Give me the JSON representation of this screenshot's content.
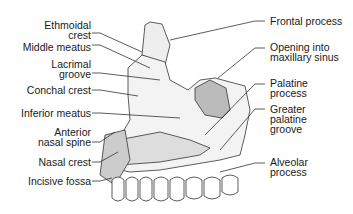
{
  "diagram": {
    "labels_left": [
      {
        "id": "ethmoidal-crest",
        "line1": "Ethmoidal",
        "line2": "crest"
      },
      {
        "id": "middle-meatus",
        "line1": "Middle meatus",
        "line2": ""
      },
      {
        "id": "lacrimal-groove",
        "line1": "Lacrimal",
        "line2": "groove"
      },
      {
        "id": "conchal-crest",
        "line1": "Conchal crest",
        "line2": ""
      },
      {
        "id": "inferior-meatus",
        "line1": "Inferior meatus",
        "line2": ""
      },
      {
        "id": "anterior-nasal-spine",
        "line1": "Anterior",
        "line2": "nasal spine"
      },
      {
        "id": "nasal-crest",
        "line1": "Nasal crest",
        "line2": ""
      },
      {
        "id": "incisive-fossa",
        "line1": "Incisive fossa",
        "line2": ""
      }
    ],
    "labels_right": [
      {
        "id": "frontal-process",
        "line1": "Frontal process",
        "line2": "",
        "line3": ""
      },
      {
        "id": "opening-maxillary-sinus",
        "line1": "Opening into",
        "line2": "maxillary sinus",
        "line3": ""
      },
      {
        "id": "palatine-process",
        "line1": "Palatine",
        "line2": "process",
        "line3": ""
      },
      {
        "id": "greater-palatine-groove",
        "line1": "Greater",
        "line2": "palatine",
        "line3": "groove"
      },
      {
        "id": "alveolar-process",
        "line1": "Alveolar",
        "line2": "process",
        "line3": ""
      }
    ]
  }
}
